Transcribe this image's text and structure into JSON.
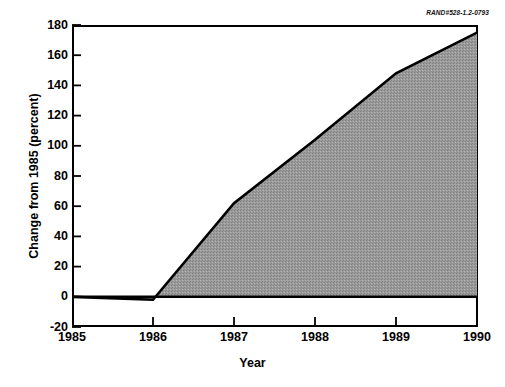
{
  "figure": {
    "corner_code": "RAND#528-1.2-0793",
    "background_color": "#ffffff",
    "frame_color": "#000000",
    "fill_color": "#999999"
  },
  "axis": {
    "x_title": "Year",
    "y_title": "Change from 1985 (percent)",
    "y_ticks": [
      "180",
      "160",
      "140",
      "120",
      "100",
      "80",
      "60",
      "40",
      "20",
      "0",
      "-20"
    ],
    "x_ticks": [
      "1985",
      "1986",
      "1987",
      "1988",
      "1989",
      "1990"
    ]
  },
  "chart_data": {
    "type": "area",
    "title": "",
    "subtitle": "",
    "xlabel": "Year",
    "ylabel": "Change from 1985 (percent)",
    "xlim": [
      1985,
      1990
    ],
    "ylim": [
      -20,
      180
    ],
    "ytick_values": [
      180,
      160,
      140,
      120,
      100,
      80,
      60,
      40,
      20,
      0,
      -20
    ],
    "xtick_values": [
      1985,
      1986,
      1987,
      1988,
      1989,
      1990
    ],
    "grid": false,
    "legend": "none",
    "baseline": 0,
    "fill_color": "#999999",
    "line_color": "#000000",
    "annotations": [
      "RAND#528-1.2-0793"
    ],
    "x": [
      1985,
      1986,
      1987,
      1988,
      1989,
      1990
    ],
    "values": [
      0,
      -2,
      62,
      104,
      148,
      175
    ],
    "series": [
      {
        "name": "Change from 1985",
        "x": [
          1985,
          1986,
          1987,
          1988,
          1989,
          1990
        ],
        "values": [
          0,
          -2,
          62,
          104,
          148,
          175
        ]
      }
    ]
  }
}
